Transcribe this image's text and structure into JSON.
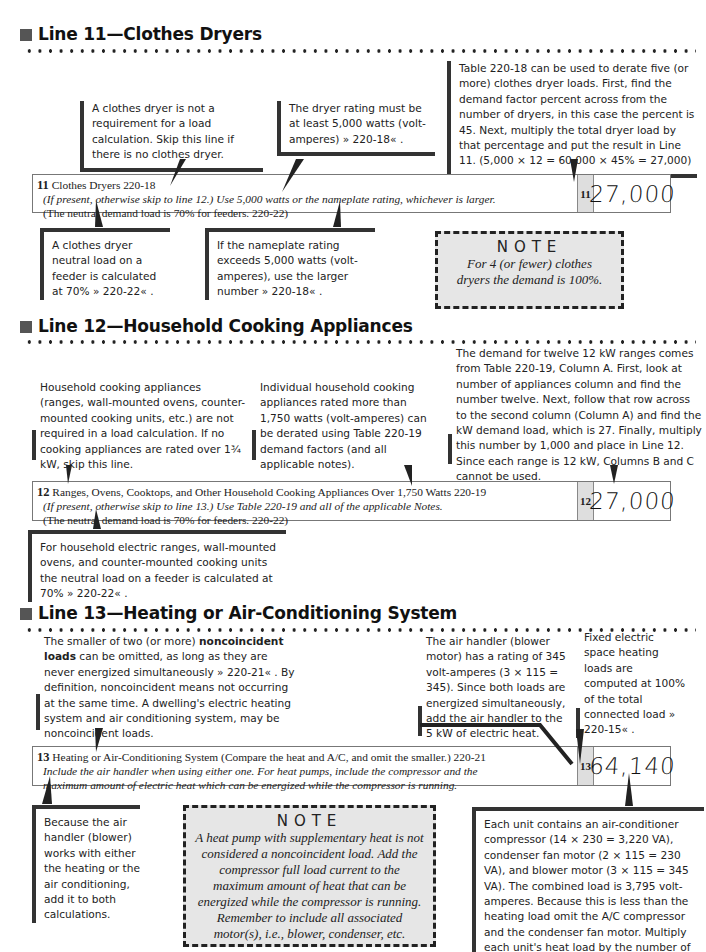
{
  "sections": [
    {
      "heading": "Line 11—Clothes Dryers",
      "callouts_above": [
        {
          "text": "A clothes dryer is not a requirement for a load calculation. Skip this line if there is no clothes dryer."
        },
        {
          "text": "The dryer rating must be at least 5,000 watts (volt-amperes) » 220-18« ."
        },
        {
          "text": "Table 220-18 can be used to derate five (or more) clothes dryer loads. First, find the demand factor percent across from the number of dryers, in this case the percent is 45. Next, multiply the total dryer load by that percentage and put the result in Line 11. (5,000 × 12 = 60,000 × 45% = 27,000)"
        }
      ],
      "form_line": {
        "number": "11",
        "title": "Clothes Dryers  220-18",
        "italic": "(If present, otherwise skip to line 12.) Use 5,000 watts or the nameplate rating, whichever is larger.",
        "plain": "(The neutral demand load is 70% for feeders.  220-22)",
        "line_box": "11",
        "value": "27,000"
      },
      "callouts_below": [
        {
          "text": "A clothes dryer neutral load on a feeder is calculated at 70% » 220-22« ."
        },
        {
          "text": "If the nameplate rating exceeds 5,000 watts (volt-amperes), use the larger number » 220-18« ."
        }
      ],
      "note": {
        "title": "NOTE",
        "body": "For 4 (or fewer) clothes dryers the demand is 100%."
      }
    },
    {
      "heading": "Line 12—Household Cooking Appliances",
      "callouts_above": [
        {
          "text": "Household cooking appliances (ranges, wall-mounted ovens, counter-mounted cooking units, etc.) are not required in a load calculation. If no cooking appliances are rated over 1¾ kW, skip this line."
        },
        {
          "text": "Individual household cooking appliances rated more than 1,750 watts (volt-amperes) can be derated using Table 220-19 demand factors (and all applicable notes)."
        },
        {
          "text": "The demand for twelve 12 kW ranges comes from Table 220-19, Column A. First, look at number of appliances column and find the number twelve. Next, follow that row across to the second column (Column A) and find the kW demand load, which is 27. Finally, multiply this number by 1,000 and place in Line 12. Since each range is 12 kW, Columns B and C cannot be used."
        }
      ],
      "form_line": {
        "number": "12",
        "title": "Ranges, Ovens, Cooktops, and Other Household Cooking Appliances Over 1,750 Watts  220-19",
        "italic": "(If present, otherwise skip to line 13.) Use Table 220-19 and all of the applicable Notes.",
        "plain": "(The neutral demand load is 70% for feeders.  220-22)",
        "line_box": "12",
        "value": "27,000"
      },
      "callouts_below": [
        {
          "text": "For household electric ranges, wall-mounted ovens, and counter-mounted cooking units the neutral load on a feeder is calculated at 70% » 220-22« ."
        }
      ]
    },
    {
      "heading": "Line 13—Heating or Air-Conditioning System",
      "callouts_above": [
        {
          "text_pre": "The smaller of two (or more) ",
          "bold": "noncoincident loads",
          "text_post": " can be omitted, as long as they are never energized simultaneously » 220-21« . By definition, noncoincident means not occurring at the same time. A dwelling's electric heating system and air conditioning system, may be noncoincident loads."
        },
        {
          "text": "The air handler (blower motor) has a rating of 345 volt-amperes (3 × 115 = 345). Since both loads are energized simultaneously, add the air handler to the 5 kW of electric heat."
        },
        {
          "text": "Fixed electric space heating loads are computed at 100% of the total connected load » 220-15« ."
        }
      ],
      "form_line": {
        "number": "13",
        "title": "Heating or Air-Conditioning System (Compare the heat and A/C, and omit the smaller.)  220-21",
        "italic": "Include the air handler when using either one. For heat pumps, include the compressor and the",
        "italic2": "maximum amount of electric heat which can be energized while the compressor is running.",
        "line_box": "13",
        "value": "64,140"
      },
      "callouts_below": [
        {
          "text": "Because the air handler (blower) works with either the heating or the air conditioning, add it to both calculations."
        },
        {
          "text": "Each unit contains an air-conditioner compressor (14 × 230 = 3,220 VA), condenser fan motor (2 × 115 = 230 VA), and blower motor (3 × 115 = 345 VA). The combined load is 3,795 volt-amperes. Because this is less than the heating load omit the A/C compressor and the condenser fan motor. Multiply each unit's heat load by the number of units. (5,345 × 12 = 64,140)"
        }
      ],
      "note": {
        "title": "NOTE",
        "body": "A heat pump with supplementary heat is not considered a noncoincident load. Add the compressor full load current to the maximum amount of heat that can be energized while the compressor is running. Remember to include all associated motor(s), i.e., blower, condenser, etc."
      }
    }
  ],
  "icons": {
    "section_marker": "square-bullet-icon",
    "ref_open": "»",
    "ref_close": "«"
  }
}
